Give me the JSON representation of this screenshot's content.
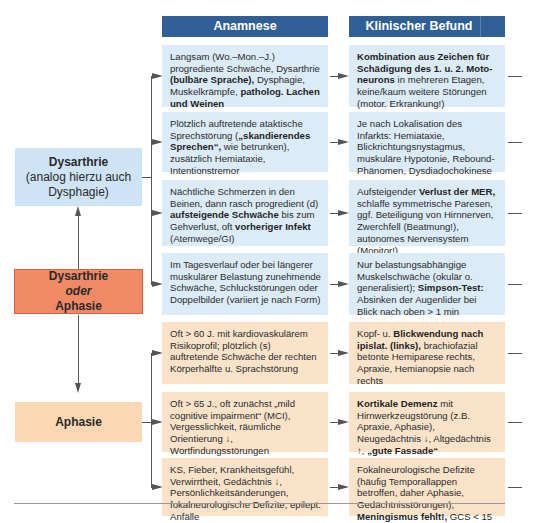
{
  "headers": {
    "anamnese": "Anamnese",
    "befund": "Klinischer Befund"
  },
  "left_boxes": {
    "dysarthrie": {
      "title": "Dysarthrie",
      "subtitle_1": "(analog hierzu auch",
      "subtitle_2": "Dysphagie)"
    },
    "dysarthrie_oder_aphasie": {
      "line1": "Dysarthrie",
      "line2": "oder",
      "line3": "Aphasie"
    },
    "aphasie": {
      "title": "Aphasie"
    }
  },
  "rows": [
    {
      "group": "dysarthrie",
      "anamnese": [
        {
          "t": "Langsam (Wo.–Mon.–J.) progrediente Schwäche, Dysarthrie "
        },
        {
          "t": "(bulbäre Sprache),",
          "b": true
        },
        {
          "t": " Dysphagie, Muskelkrämpfe, "
        },
        {
          "t": "patholog. Lachen und Weinen",
          "b": true
        }
      ],
      "befund": [
        {
          "t": "Kombination aus Zeichen für Schädigung des 1. u. 2. Moto­neurons",
          "b": true
        },
        {
          "t": " in mehreren Etagen, keine/kaum weitere Störungen (motor. Erkrankung!)"
        }
      ]
    },
    {
      "group": "dysarthrie",
      "anamnese": [
        {
          "t": "Plötzlich auftretende ataktische Sprechstörung ("
        },
        {
          "t": "„skandierendes Sprechen“,",
          "b": true
        },
        {
          "t": " wie betrunken), zusätzlich Hemiataxie, Intentionstremor"
        }
      ],
      "befund": [
        {
          "t": "Je nach Lokalisation des Infarkts: Hemiataxie, Blickrichtungsnystagmus, muskuläre Hypotonie, Rebound-Phänomen, Dysdiadochokinese"
        }
      ]
    },
    {
      "group": "dysarthrie",
      "anamnese": [
        {
          "t": "Nächtliche Schmerzen in den Beinen, dann rasch progredient (d) "
        },
        {
          "t": "auf­steigende Schwäche",
          "b": true
        },
        {
          "t": " bis zum Gehverlust, oft "
        },
        {
          "t": "vorheriger Infekt",
          "b": true
        },
        {
          "t": " (Atemwege/GI)"
        }
      ],
      "befund": [
        {
          "t": "Aufsteigender "
        },
        {
          "t": "Verlust der MER,",
          "b": true
        },
        {
          "t": " schlaffe symmetrische Paresen, ggf. Beteiligung von Hirnnerven, Zwerchfell (Beatmung!), autonomes Nervensystem (Monitor!)"
        }
      ]
    },
    {
      "group": "dysarthrie",
      "anamnese": [
        {
          "t": "Im Tagesverlauf oder bei längerer muskulärer Belastung zunehmende Schwäche, Schluckstörungen oder Doppelbilder (variiert je nach Form)"
        }
      ],
      "befund": [
        {
          "t": "Nur belastungsabhängige Muskel­schwäche (okulär o. generalisiert); "
        },
        {
          "t": "Simpson-Test:",
          "b": true
        },
        {
          "t": " Absinken der Augen­lider bei Blick nach oben > 1 min"
        }
      ]
    },
    {
      "group": "aphasie",
      "anamnese": [
        {
          "t": "Oft > 60 J. mit kardiovaskulärem Risikoprofil; plötzlich (s) auftretende Schwäche der rechten Körperhälfte u. Sprachstörung"
        }
      ],
      "befund": [
        {
          "t": "Kopf- u. "
        },
        {
          "t": "Blickwendung nach ipislat. (links),",
          "b": true
        },
        {
          "t": " brachiofazial betonte Hemiparese rechts, Apraxie, Hemianopsie nach rechts"
        }
      ]
    },
    {
      "group": "aphasie",
      "anamnese": [
        {
          "t": "Oft > 65 J., oft zunächst „mild cognitive impairment“ (MCI), Vergesslichkeit, räumliche Orientierung ↓, Wortfindungsstörungen"
        }
      ],
      "befund": [
        {
          "t": "Kortikale Demenz",
          "b": true
        },
        {
          "t": " mit Hirnwerkzeug­störung (z.B. Apraxie, Aphasie), Neugedächtnis ↓, Altgedächtnis ↑, "
        },
        {
          "t": "„gute Fassade“",
          "b": true
        }
      ]
    },
    {
      "group": "aphasie",
      "anamnese": [
        {
          "t": "KS, Fieber, Krankheitsgefühl, Verwirrtheit, Gedächtnis ↓, Persönlich­keitsänderungen, fokalneurologische Defizite, epilept. Anfälle"
        }
      ],
      "befund": [
        {
          "t": "Fokalneurologische Defizite (häufig Temporallappen betroffen, daher Aphasie, Gedächtnisstörungen), "
        },
        {
          "t": "Meningismus fehlt!,",
          "b": true
        },
        {
          "t": " GCS < 15"
        }
      ]
    }
  ],
  "colors": {
    "header_blue": "#2f5f95",
    "cell_blue": "#dcebf8",
    "cell_peach": "#fbe3ca",
    "central_box": "#f08a66",
    "aphasie_box": "#fbd8b3",
    "dysarthrie_box": "#cfe3f6",
    "connector": "#555555"
  }
}
